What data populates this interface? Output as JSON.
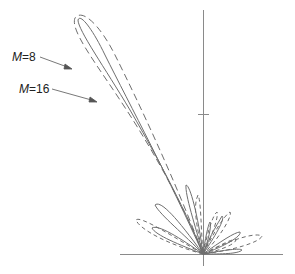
{
  "diagram": {
    "type": "polar radiation pattern",
    "colors": {
      "axis": "#8a8a8a",
      "curve": "#6e6e6e",
      "text": "#222222"
    },
    "labels": [
      {
        "id": "m8",
        "var": "M",
        "eq": "=",
        "value": "8",
        "style": "dashed",
        "text": "M=8"
      },
      {
        "id": "m16",
        "var": "M",
        "eq": "=",
        "value": "16",
        "style": "solid",
        "text": "M=16"
      }
    ],
    "axes": {
      "vertical": {
        "tick_count": 1
      },
      "horizontal": {}
    }
  }
}
